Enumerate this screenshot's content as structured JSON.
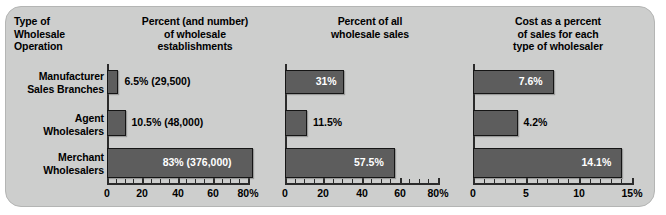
{
  "chart_data": [
    {
      "type": "bar",
      "orientation": "horizontal",
      "title": "Percent (and number) of wholesale establishments",
      "categories": [
        "Manufacturer Sales Branches",
        "Agent Wholesalers",
        "Merchant Wholesalers"
      ],
      "values": [
        6.5,
        10.5,
        83
      ],
      "data_labels": [
        "6.5% (29,500)",
        "10.5% (48,000)",
        "83% (376,000)"
      ],
      "xlabel": "",
      "ylabel": "",
      "xlim": [
        0,
        80
      ],
      "xticks": [
        0,
        20,
        40,
        60,
        80
      ],
      "xticklabels": [
        "0",
        "20",
        "40",
        "60",
        "80%"
      ],
      "grid": false,
      "legend": "none"
    },
    {
      "type": "bar",
      "orientation": "horizontal",
      "title": "Percent of all wholesale sales",
      "categories": [
        "Manufacturer Sales Branches",
        "Agent Wholesalers",
        "Merchant Wholesalers"
      ],
      "values": [
        31,
        11.5,
        57.5
      ],
      "data_labels": [
        "31%",
        "11.5%",
        "57.5%"
      ],
      "xlabel": "",
      "ylabel": "",
      "xlim": [
        0,
        80
      ],
      "xticks": [
        0,
        20,
        40,
        60,
        80
      ],
      "xticklabels": [
        "0",
        "20",
        "40",
        "60",
        "80%"
      ],
      "grid": false,
      "legend": "none"
    },
    {
      "type": "bar",
      "orientation": "horizontal",
      "title": "Cost as a percent of sales for each type of wholesaler",
      "categories": [
        "Manufacturer Sales Branches",
        "Agent Wholesalers",
        "Merchant Wholesalers"
      ],
      "values": [
        7.6,
        4.2,
        14.1
      ],
      "data_labels": [
        "7.6%",
        "4.2%",
        "14.1%"
      ],
      "xlabel": "",
      "ylabel": "",
      "xlim": [
        0,
        15
      ],
      "xticks": [
        0,
        5,
        10,
        15
      ],
      "xticklabels": [
        "0",
        "5",
        "10",
        "15%"
      ],
      "grid": false,
      "legend": "none"
    }
  ],
  "headers": [
    "Type of\nWholesale\nOperation",
    "Percent (and number)\nof wholesale\nestablishments",
    "Percent of all\nwholesale sales",
    "Cost as a percent\nof sales for each\ntype of wholesaler"
  ],
  "header_lines": {
    "col0": [
      "Type of",
      "Wholesale",
      "Operation"
    ],
    "col1": [
      "Percent (and number)",
      "of wholesale",
      "establishments"
    ],
    "col2": [
      "Percent of all",
      "wholesale sales"
    ],
    "col3": [
      "Cost as a percent",
      "of sales for each",
      "type of wholesaler"
    ]
  },
  "row_labels": [
    [
      "Manufacturer",
      "Sales Branches"
    ],
    [
      "Agent",
      "Wholesalers"
    ],
    [
      "Merchant",
      "Wholesalers"
    ]
  ],
  "colors": {
    "panel_background": "#cdcecd",
    "panel_border": "#b4b5b4",
    "bar_fill": "#5d5d5d",
    "bar_border": "#151515",
    "axis": "#2b2b2b",
    "text": "#000000",
    "inner_label_text": "#ffffff"
  }
}
